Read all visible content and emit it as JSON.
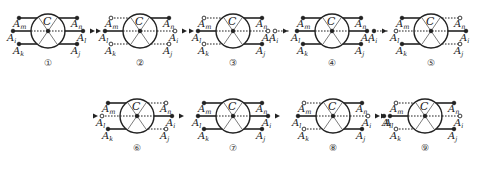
{
  "center_label": "C",
  "node_labels": {
    "m": "m",
    "n": "n",
    "i": "i",
    "j": "j",
    "k": "k",
    "l": "l",
    "prefix": "A"
  },
  "styles": {
    "stroke": "#222222",
    "background": "#ffffff"
  },
  "diagrams": [
    {
      "id": 1,
      "label": "①",
      "cx": 48,
      "cy": 31,
      "left": {
        "top": "solid",
        "mid": "solid",
        "bot": "solid"
      },
      "right": {
        "top": "solid",
        "mid": "solid",
        "bot": "solid"
      },
      "mid_left_label": "i",
      "mid_right_label": "l",
      "arrow_out": true
    },
    {
      "id": 2,
      "label": "②",
      "cx": 140,
      "cy": 31,
      "left": {
        "top": "dotted",
        "mid": "solid",
        "bot": "dotted"
      },
      "right": {
        "top": "solid",
        "mid": "dotted",
        "bot": "dotted"
      },
      "mid_left_label": "l",
      "mid_right_label": "i",
      "arrow_in": true,
      "arrow_out": true
    },
    {
      "id": 3,
      "label": "③",
      "cx": 233,
      "cy": 31,
      "left": {
        "top": "dotted",
        "mid": "solid",
        "bot": "dotted"
      },
      "right": {
        "top": "solid",
        "mid": "dotted",
        "bot": "solid"
      },
      "mid_left_label": "l",
      "mid_right_label": "i",
      "arrow_in": true
    },
    {
      "id": 4,
      "label": "④",
      "cx": 332,
      "cy": 31,
      "left": {
        "top": "solid",
        "mid": "solid",
        "bot": "solid"
      },
      "right": {
        "top": "solid",
        "mid": "solid",
        "bot": "solid"
      },
      "mid_left_label": "l",
      "mid_right_label": "i",
      "pre_node": "i",
      "arrow_in": true
    },
    {
      "id": 5,
      "label": "⑤",
      "cx": 431,
      "cy": 31,
      "left": {
        "top": "solid",
        "mid": "dotted",
        "bot": "solid"
      },
      "right": {
        "top": "dotted",
        "mid": "solid",
        "bot": "dotted"
      },
      "mid_left_label": "l",
      "mid_right_label": "i",
      "pre_node": "i",
      "arrow_in": true
    },
    {
      "id": 6,
      "label": "⑥",
      "cx": 137,
      "cy": 116,
      "left": {
        "top": "solid",
        "mid": "dotted",
        "bot": "solid"
      },
      "right": {
        "top": "dotted",
        "mid": "solid",
        "bot": "dotted"
      },
      "mid_left_label": "l",
      "mid_right_label": "i",
      "arrow_in": true,
      "arrow_out": true
    },
    {
      "id": 7,
      "label": "⑦",
      "cx": 233,
      "cy": 116,
      "left": {
        "top": "solid",
        "mid": "solid",
        "bot": "solid"
      },
      "right": {
        "top": "solid",
        "mid": "solid",
        "bot": "solid"
      },
      "mid_left_label": "l",
      "mid_right_label": "i",
      "arrow_out": true
    },
    {
      "id": 8,
      "label": "⑧",
      "cx": 333,
      "cy": 116,
      "left": {
        "top": "dotted",
        "mid": "solid",
        "bot": "dotted"
      },
      "right": {
        "top": "solid",
        "mid": "dotted",
        "bot": "solid"
      },
      "mid_left_label": "l",
      "mid_right_label": "i",
      "arrow_out": true,
      "post_node": "l"
    },
    {
      "id": 9,
      "label": "⑨",
      "cx": 425,
      "cy": 116,
      "left": {
        "top": "dotted",
        "mid": "solid",
        "bot": "dotted"
      },
      "right": {
        "top": "solid",
        "mid": "dotted",
        "bot": "solid"
      },
      "mid_left_label": "l",
      "mid_right_label": "i",
      "arrow_in": true
    }
  ]
}
